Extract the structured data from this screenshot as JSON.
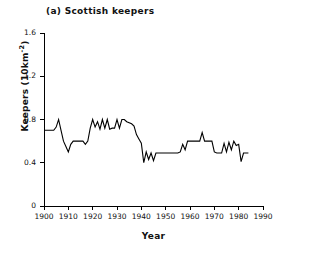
{
  "figure": {
    "panel_label": "(a) Scottish keepers",
    "background_color": "#ffffff",
    "line_color": "#000000",
    "axis_color": "#000000"
  },
  "chart_data": {
    "type": "line",
    "title": "(a) Scottish keepers",
    "xlabel": "Year",
    "ylabel": "Keepers (10km⁻²)",
    "ylabel_text": "Keepers (10km",
    "ylabel_exponent": "-2",
    "ylabel_suffix": ")",
    "xlim": [
      1900,
      1990
    ],
    "ylim": [
      0,
      1.6
    ],
    "xticks": [
      1900,
      1910,
      1920,
      1930,
      1940,
      1950,
      1960,
      1970,
      1980,
      1990
    ],
    "xtick_labels": [
      "1900",
      "1910",
      "1920",
      "1930",
      "1940",
      "1950",
      "1960",
      "1970",
      "1980",
      "1990"
    ],
    "yticks": [
      0,
      0.4,
      0.8,
      1.2,
      1.6
    ],
    "ytick_labels": [
      "0",
      "0.4",
      "0.8",
      "1.2",
      "1.6"
    ],
    "grid": false,
    "legend": false,
    "series": [
      {
        "name": "Scottish keepers",
        "color": "#000000",
        "x": [
          1900,
          1901,
          1902,
          1903,
          1904,
          1905,
          1906,
          1907,
          1908,
          1909,
          1910,
          1911,
          1912,
          1913,
          1914,
          1915,
          1916,
          1917,
          1918,
          1919,
          1920,
          1921,
          1922,
          1923,
          1924,
          1925,
          1926,
          1927,
          1928,
          1929,
          1930,
          1931,
          1932,
          1933,
          1934,
          1935,
          1936,
          1937,
          1938,
          1939,
          1940,
          1941,
          1942,
          1943,
          1944,
          1945,
          1946,
          1947,
          1948,
          1949,
          1950,
          1951,
          1952,
          1953,
          1954,
          1955,
          1956,
          1957,
          1958,
          1959,
          1960,
          1961,
          1962,
          1963,
          1964,
          1965,
          1966,
          1967,
          1968,
          1969,
          1970,
          1971,
          1972,
          1973,
          1974,
          1975,
          1976,
          1977,
          1978,
          1979,
          1980,
          1981,
          1982,
          1983,
          1984
        ],
        "y": [
          0.7,
          0.7,
          0.7,
          0.7,
          0.7,
          0.73,
          0.8,
          0.7,
          0.6,
          0.55,
          0.5,
          0.57,
          0.6,
          0.6,
          0.6,
          0.6,
          0.6,
          0.57,
          0.6,
          0.72,
          0.8,
          0.73,
          0.78,
          0.71,
          0.8,
          0.72,
          0.8,
          0.71,
          0.72,
          0.72,
          0.8,
          0.72,
          0.8,
          0.8,
          0.78,
          0.77,
          0.76,
          0.74,
          0.66,
          0.62,
          0.58,
          0.4,
          0.5,
          0.43,
          0.49,
          0.42,
          0.49,
          0.49,
          0.49,
          0.49,
          0.49,
          0.49,
          0.49,
          0.49,
          0.49,
          0.49,
          0.5,
          0.57,
          0.52,
          0.6,
          0.6,
          0.6,
          0.6,
          0.6,
          0.6,
          0.68,
          0.6,
          0.6,
          0.6,
          0.6,
          0.5,
          0.49,
          0.49,
          0.49,
          0.58,
          0.5,
          0.59,
          0.52,
          0.6,
          0.56,
          0.57,
          0.41,
          0.49,
          0.49,
          0.49
        ]
      }
    ]
  }
}
